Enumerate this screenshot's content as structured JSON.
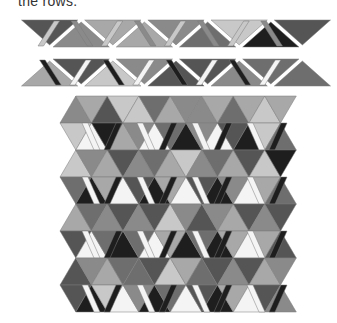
{
  "caption": "the rows.",
  "colors": {
    "black": "#1e1e1e",
    "dark": "#555555",
    "middark": "#6e6e6e",
    "mid": "#8a8a8a",
    "light": "#a8a8a8",
    "pale": "#c8c8c8",
    "white": "#f4f4f4"
  },
  "strip1": {
    "y": 20,
    "h": 27,
    "x0": 18,
    "unit": 19.6,
    "pieces": [
      {
        "type": "down",
        "color": "dark"
      },
      {
        "type": "para-f",
        "color": "pale"
      },
      {
        "type": "up",
        "color": "mid"
      },
      {
        "type": "para-b",
        "color": "mid"
      },
      {
        "type": "down",
        "color": "light"
      },
      {
        "type": "para-f",
        "color": "pale"
      },
      {
        "type": "up",
        "color": "light"
      },
      {
        "type": "para-b",
        "color": "mid"
      },
      {
        "type": "down",
        "color": "mid"
      },
      {
        "type": "para-f",
        "color": "pale"
      },
      {
        "type": "up",
        "color": "middark"
      },
      {
        "type": "para-b",
        "color": "mid"
      },
      {
        "type": "down",
        "color": "pale"
      },
      {
        "type": "para-f",
        "color": "pale"
      },
      {
        "type": "up",
        "color": "black"
      },
      {
        "type": "para-b",
        "color": "mid"
      },
      {
        "type": "down",
        "color": "dark"
      }
    ]
  },
  "strip2": {
    "y": 59,
    "h": 27,
    "x0": 18,
    "unit": 19.6,
    "pieces": [
      {
        "type": "up",
        "color": "light"
      },
      {
        "type": "para-b",
        "color": "black"
      },
      {
        "type": "down",
        "color": "dark"
      },
      {
        "type": "para-f",
        "color": "white"
      },
      {
        "type": "up",
        "color": "pale"
      },
      {
        "type": "para-b",
        "color": "black"
      },
      {
        "type": "down",
        "color": "mid"
      },
      {
        "type": "para-f",
        "color": "white"
      },
      {
        "type": "up",
        "color": "dark"
      },
      {
        "type": "para-b",
        "color": "black"
      },
      {
        "type": "down",
        "color": "dark"
      },
      {
        "type": "para-f",
        "color": "white"
      },
      {
        "type": "up",
        "color": "mid"
      },
      {
        "type": "para-b",
        "color": "black"
      },
      {
        "type": "down",
        "color": "middark"
      },
      {
        "type": "para-f",
        "color": "white"
      },
      {
        "type": "up",
        "color": "middark"
      }
    ]
  },
  "quilt": {
    "x0": 60,
    "y0": 96,
    "rowH": 27,
    "triW": 31.5,
    "rows": [
      [
        "mid",
        "light",
        "dark",
        "pale",
        "pale",
        "middark",
        "light",
        "mid",
        "mid",
        "light",
        "middark",
        "light",
        "pale",
        "light"
      ],
      [
        "pale",
        "white",
        "black",
        "light",
        "mid",
        "white",
        "middark",
        "black",
        "mid",
        "white",
        "dark",
        "black",
        "pale",
        "middark"
      ],
      [
        "pale",
        "mid",
        "light",
        "dark",
        "mid",
        "middark",
        "light",
        "pale",
        "mid",
        "middark",
        "light",
        "dark",
        "pale",
        "black"
      ],
      [
        "middark",
        "black",
        "light",
        "white",
        "dark",
        "black",
        "light",
        "white",
        "dark",
        "black",
        "mid",
        "white",
        "light",
        "middark"
      ],
      [
        "light",
        "middark",
        "mid",
        "dark",
        "mid",
        "dark",
        "pale",
        "mid",
        "dark",
        "mid",
        "light",
        "dark",
        "mid",
        "dark"
      ],
      [
        "dark",
        "white",
        "middark",
        "black",
        "middark",
        "white",
        "light",
        "black",
        "middark",
        "black",
        "light",
        "white",
        "light",
        "dark"
      ],
      [
        "dark",
        "mid",
        "light",
        "middark",
        "middark",
        "dark",
        "pale",
        "light",
        "middark",
        "dark",
        "mid",
        "dark",
        "light",
        "mid"
      ],
      [
        "dark",
        "black",
        "pale",
        "white",
        "mid",
        "black",
        "middark",
        "white",
        "dark",
        "black",
        "light",
        "white",
        "dark",
        "mid"
      ]
    ]
  }
}
